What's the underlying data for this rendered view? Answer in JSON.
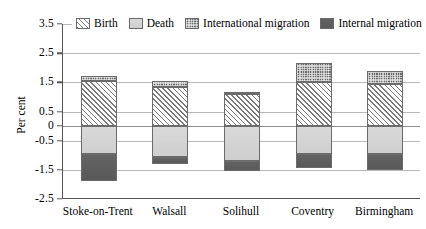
{
  "chart_data": {
    "type": "bar",
    "title": "",
    "xlabel": "",
    "ylabel": "Per cent",
    "ylim": [
      -2.5,
      3.5
    ],
    "yticks": [
      3.5,
      2.5,
      1.5,
      0.5,
      0,
      -0.5,
      -1.5,
      -2.5
    ],
    "ytick_labels": [
      "3.5",
      "2.5",
      "1.5",
      "0.5",
      "0",
      "-0.5",
      "-1.5",
      "-2.5"
    ],
    "grid": true,
    "stacked": true,
    "legend_position": "top",
    "categories": [
      "Stoke-on-Trent",
      "Walsall",
      "Solihull",
      "Coventry",
      "Birmingham"
    ],
    "series": [
      {
        "name": "Birth",
        "values": [
          1.55,
          1.35,
          1.1,
          1.5,
          1.45
        ]
      },
      {
        "name": "Death",
        "values": [
          -0.95,
          -1.05,
          -1.2,
          -0.95,
          -0.95
        ]
      },
      {
        "name": "International migration",
        "values": [
          0.17,
          0.2,
          0.07,
          0.65,
          0.45
        ]
      },
      {
        "name": "Internal migration",
        "values": [
          -0.95,
          -0.25,
          -0.35,
          -0.5,
          -0.55
        ]
      }
    ]
  },
  "legend": {
    "items": [
      {
        "label": "Birth",
        "key": "birth",
        "pattern": "diagonal-hatch"
      },
      {
        "label": "Death",
        "key": "death",
        "pattern": "light-solid"
      },
      {
        "label": "International migration",
        "key": "intl",
        "pattern": "dark-checker"
      },
      {
        "label": "Internal migration",
        "key": "internal",
        "pattern": "dark-solid"
      }
    ]
  },
  "axis": {
    "y_title": "Per cent"
  }
}
